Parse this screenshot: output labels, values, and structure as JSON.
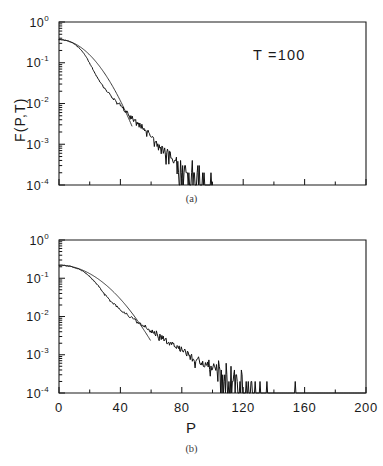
{
  "figure": {
    "caption_a": "(a)",
    "caption_b": "(b)",
    "xaxis_title": "P",
    "yaxis_title": "F(P,T)",
    "annotation_a": "T  =100",
    "annotation_b": "T  =200",
    "background_color": "#ffffff",
    "ink_color": "#1a1a1a"
  },
  "axes": {
    "y_tick_labels": [
      "10",
      "10",
      "10",
      "10",
      "10"
    ],
    "y_tick_exponents": [
      "0",
      "-1",
      "-2",
      "-3",
      "-4"
    ],
    "y_tick_values": [
      1,
      0.1,
      0.01,
      0.001,
      0.0001
    ],
    "x_tick_labels": [
      "0",
      "40",
      "80",
      "120",
      "160",
      "200"
    ],
    "x_tick_values": [
      0,
      40,
      80,
      120,
      160,
      200
    ],
    "x_minor_step": 20,
    "yscale": "log",
    "xscale": "linear"
  },
  "chart_data": [
    {
      "type": "line",
      "panel": "a",
      "title": "",
      "subtitle": "",
      "xlabel": "",
      "ylabel": "F(P,T)",
      "annotation": "T  =100",
      "panel_label": "(a)",
      "yscale": "log",
      "xlim": [
        0,
        200
      ],
      "ylim": [
        0.0001,
        1
      ],
      "grid": false,
      "legend": "none",
      "x_ticks": [
        0,
        40,
        80,
        120,
        160,
        200
      ],
      "x_tick_labels_shown": false,
      "y_ticks": [
        1,
        0.1,
        0.01,
        0.001,
        0.0001
      ],
      "series": [
        {
          "name": "gaussian-reference",
          "style": "thin-smooth",
          "description": "Gaussian reference curve exp(-(P/P0)^2) falling below 1e-4 near P=47",
          "model": "gaussian",
          "amplitude": 0.37,
          "width": 21.5,
          "x_start": 0,
          "x_cutoff": 47
        },
        {
          "name": "measured-distribution",
          "style": "thick-noisy",
          "description": "Measured distribution with stretched-exponential fat tail, noise growing toward the tail, data terminating near P=100",
          "model": "stretched-exponential",
          "amplitude": 0.37,
          "scale": 10.0,
          "exponent": 0.95,
          "gauss_core_width": 21.5,
          "x_start": 0,
          "x_end": 100,
          "noise_floor": 0.0001,
          "sample_step": 0.45,
          "seed": 7
        }
      ]
    },
    {
      "type": "line",
      "panel": "b",
      "title": "",
      "subtitle": "",
      "xlabel": "P",
      "ylabel": "F(P,T)",
      "annotation": "T  =200",
      "panel_label": "(b)",
      "yscale": "log",
      "xlim": [
        0,
        200
      ],
      "ylim": [
        0.0001,
        1
      ],
      "grid": false,
      "legend": "none",
      "x_ticks": [
        0,
        40,
        80,
        120,
        160,
        200
      ],
      "x_tick_labels_shown": true,
      "y_ticks": [
        1,
        0.1,
        0.01,
        0.001,
        0.0001
      ],
      "series": [
        {
          "name": "gaussian-reference",
          "style": "thin-smooth",
          "description": "Gaussian reference curve falling below 1e-4 near P=59",
          "model": "gaussian",
          "amplitude": 0.22,
          "width": 28.0,
          "x_start": 0,
          "x_cutoff": 59
        },
        {
          "name": "measured-distribution",
          "style": "thick-noisy",
          "description": "Measured distribution with fat tail and sparse noise spikes extending to P=200",
          "model": "stretched-exponential",
          "amplitude": 0.22,
          "scale": 13.5,
          "exponent": 0.92,
          "gauss_core_width": 28.0,
          "x_start": 0,
          "x_end": 200,
          "noise_floor": 0.0001,
          "sample_step": 0.45,
          "seed": 23
        }
      ]
    }
  ]
}
